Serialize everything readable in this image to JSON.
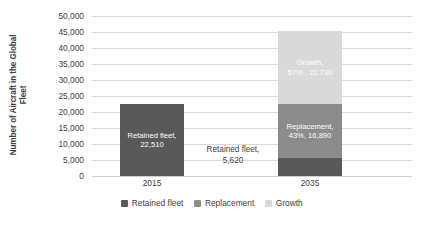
{
  "chart_data": {
    "type": "bar",
    "subtype": "stacked-column",
    "title": "",
    "xlabel": "",
    "ylabel": "Number of Aircraft in the Global Fleet",
    "ylabel_lines": [
      "Number of Aircraft in the Global",
      "Fleet"
    ],
    "categories": [
      "2015",
      "2035"
    ],
    "ylim": [
      0,
      50000
    ],
    "ytick_step": 5000,
    "ytick_labels": [
      "50,000",
      "45,000",
      "40,000",
      "35,000",
      "30,000",
      "25,000",
      "20,000",
      "15,000",
      "10,000",
      "5,000",
      "0"
    ],
    "ytick_values": [
      50000,
      45000,
      40000,
      35000,
      30000,
      25000,
      20000,
      15000,
      10000,
      5000,
      0
    ],
    "grid": true,
    "legend_position": "bottom",
    "series": [
      {
        "name": "Retained fleet",
        "color": "#595959",
        "values": [
          22510,
          5620
        ],
        "labels": [
          "Retained fleet, 22,510",
          "Retained fleet, 5,620"
        ],
        "label_lines": [
          [
            "Retained fleet,",
            "22,510"
          ],
          [
            "Retained fleet,",
            "5,620"
          ]
        ]
      },
      {
        "name": "Replacement",
        "color": "#8c8c8c",
        "values": [
          0,
          16890
        ],
        "labels": [
          "",
          "Replacement, 43%, 16,890"
        ],
        "label_lines": [
          [],
          [
            "Replacement,",
            "43%, 16,890"
          ]
        ]
      },
      {
        "name": "Growth",
        "color": "#d9d9d9",
        "values": [
          0,
          22730
        ],
        "labels": [
          "",
          "Growth, 57% , 22,730"
        ],
        "label_lines": [
          [],
          [
            "Growth,",
            "57% , 22,730"
          ]
        ]
      }
    ],
    "totals": [
      22510,
      45240
    ],
    "annotations": [
      {
        "text": "Retained fleet, 5,620",
        "lines": [
          "Retained fleet,",
          "5,620"
        ],
        "placement": "outside-left-of-2035-base"
      }
    ]
  },
  "legend": {
    "items": [
      {
        "label": "Retained fleet",
        "color": "#595959"
      },
      {
        "label": "Replacement",
        "color": "#8c8c8c"
      },
      {
        "label": "Growth",
        "color": "#d9d9d9"
      }
    ]
  },
  "colors": {
    "retained": "#595959",
    "replacement": "#8c8c8c",
    "growth": "#d9d9d9",
    "gridline": "#d9d9d9",
    "text": "#404040",
    "background": "#ffffff"
  }
}
